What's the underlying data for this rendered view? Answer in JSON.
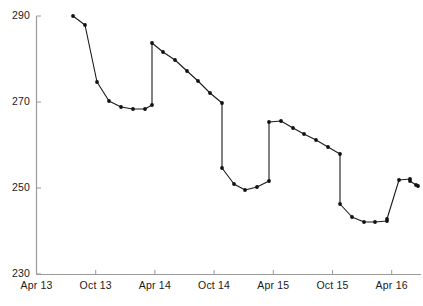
{
  "chart_data": {
    "type": "line",
    "title": "",
    "xlabel": "",
    "ylabel": "",
    "ylim": [
      230,
      290
    ],
    "yticks": [
      290,
      270,
      250,
      230
    ],
    "xticks": [
      "Apr 13",
      "Oct 13",
      "Apr 14",
      "Oct 14",
      "Apr 15",
      "Oct 15",
      "Apr 16"
    ],
    "grid": false,
    "legend": null,
    "marker": "filled-circle",
    "line_color": "#1a1a1a",
    "marker_color": "#111111",
    "axis_color": "#9a9a9a",
    "x": [
      "Apr 13",
      "May 13",
      "Jun 13",
      "Jul 13",
      "Aug 13",
      "Sep 13",
      "Oct 13",
      "Nov 13",
      "Dec 13",
      "Jan 14",
      "Feb 14",
      "Mar 14",
      "Apr 14",
      "May 14",
      "Jun 14",
      "Jul 14",
      "Aug 14",
      "Sep 14",
      "Oct 14",
      "Nov 14",
      "Dec 14",
      "Jan 15",
      "Feb 15",
      "Mar 15",
      "Apr 15",
      "May 15",
      "Jun 15",
      "Jul 15",
      "Aug 15",
      "Sep 15",
      "Oct 15",
      "Nov 15",
      "Dec 15",
      "Jan 16",
      "Feb 16",
      "Mar 16",
      "Apr 16",
      "May 16"
    ],
    "values": [
      290.0,
      287.2,
      273.5,
      269.0,
      267.8,
      267.4,
      267.4,
      268.1,
      284.2,
      282.2,
      280.2,
      277.6,
      275.0,
      272.2,
      270.0,
      256.2,
      252.4,
      251.0,
      251.8,
      253.2,
      266.8,
      267.0,
      265.5,
      264.0,
      262.6,
      261.0,
      259.3,
      247.6,
      244.4,
      243.4,
      243.4,
      243.5,
      244.0,
      253.2,
      253.4,
      252.8,
      251.8,
      251.0
    ],
    "point_pixels": [
      [
        73,
        16
      ],
      [
        85,
        25
      ],
      [
        97,
        82
      ],
      [
        109,
        101
      ],
      [
        121,
        107
      ],
      [
        133,
        109
      ],
      [
        145,
        109
      ],
      [
        152,
        105
      ],
      [
        152,
        43
      ],
      [
        163,
        52
      ],
      [
        175,
        60
      ],
      [
        187,
        71
      ],
      [
        198,
        81
      ],
      [
        210,
        93
      ],
      [
        222,
        103
      ],
      [
        222,
        168
      ],
      [
        234,
        184
      ],
      [
        245,
        190
      ],
      [
        257,
        187
      ],
      [
        269,
        181
      ],
      [
        269,
        122
      ],
      [
        281,
        121
      ],
      [
        293,
        128
      ],
      [
        304,
        134
      ],
      [
        316,
        140
      ],
      [
        328,
        147
      ],
      [
        340,
        154
      ],
      [
        340,
        204
      ],
      [
        352,
        217
      ],
      [
        364,
        222
      ],
      [
        375,
        222
      ],
      [
        387,
        221
      ],
      [
        387,
        219
      ],
      [
        399,
        180
      ],
      [
        410,
        179
      ],
      [
        410,
        181
      ],
      [
        416,
        185
      ],
      [
        418,
        186
      ]
    ]
  }
}
